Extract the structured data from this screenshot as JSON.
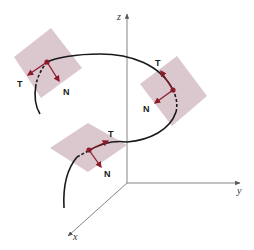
{
  "figure": {
    "axes": {
      "x_label": "x",
      "y_label": "y",
      "z_label": "z"
    },
    "vectors": {
      "tangent_label": "T",
      "normal_label": "N"
    },
    "points": [
      {
        "name": "upper-left",
        "t_label": "T",
        "n_label": "N"
      },
      {
        "name": "right",
        "t_label": "T",
        "n_label": "N"
      },
      {
        "name": "lower",
        "t_label": "T",
        "n_label": "N"
      }
    ],
    "colors": {
      "plane_fill": "#d7c2c9",
      "vector": "#8b1a2b",
      "point": "#8b1a2b",
      "curve": "#1a1a1a",
      "axis": "#777777"
    }
  }
}
